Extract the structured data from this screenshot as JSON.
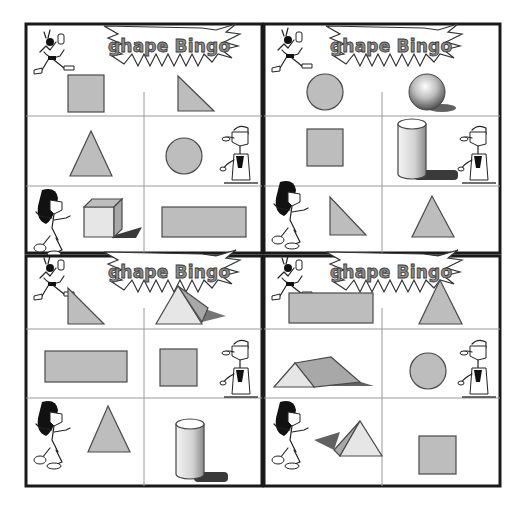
{
  "page": {
    "background": "#ffffff",
    "frame_color": "#1a1a1a",
    "shape_fill": "#bdbdbd",
    "shape_stroke": "#4a4a4a"
  },
  "cards": [
    {
      "id": "A",
      "title": "ghape Bingo",
      "cells": [
        {
          "row": 1,
          "col": 1,
          "shape": "square"
        },
        {
          "row": 1,
          "col": 2,
          "shape": "right-triangle"
        },
        {
          "row": 2,
          "col": 1,
          "shape": "triangle"
        },
        {
          "row": 2,
          "col": 2,
          "shape": "circle"
        },
        {
          "row": 3,
          "col": 1,
          "shape": "cube"
        },
        {
          "row": 3,
          "col": 2,
          "shape": "rectangle"
        }
      ]
    },
    {
      "id": "B",
      "title": "ghape Bingo",
      "cells": [
        {
          "row": 1,
          "col": 1,
          "shape": "circle"
        },
        {
          "row": 1,
          "col": 2,
          "shape": "sphere"
        },
        {
          "row": 2,
          "col": 1,
          "shape": "square"
        },
        {
          "row": 2,
          "col": 2,
          "shape": "cylinder"
        },
        {
          "row": 3,
          "col": 1,
          "shape": "right-triangle"
        },
        {
          "row": 3,
          "col": 2,
          "shape": "triangle"
        }
      ]
    },
    {
      "id": "C",
      "title": "ghape Bingo",
      "cells": [
        {
          "row": 1,
          "col": 1,
          "shape": "right-triangle"
        },
        {
          "row": 1,
          "col": 2,
          "shape": "pyramid"
        },
        {
          "row": 2,
          "col": 1,
          "shape": "rectangle"
        },
        {
          "row": 2,
          "col": 2,
          "shape": "square"
        },
        {
          "row": 3,
          "col": 1,
          "shape": "triangle"
        },
        {
          "row": 3,
          "col": 2,
          "shape": "cylinder"
        }
      ]
    },
    {
      "id": "D",
      "title": "ghape Bingo",
      "cells": [
        {
          "row": 1,
          "col": 1,
          "shape": "rectangle"
        },
        {
          "row": 1,
          "col": 2,
          "shape": "triangle"
        },
        {
          "row": 2,
          "col": 1,
          "shape": "triangular-prism"
        },
        {
          "row": 2,
          "col": 2,
          "shape": "circle"
        },
        {
          "row": 3,
          "col": 1,
          "shape": "pyramid"
        },
        {
          "row": 3,
          "col": 2,
          "shape": "square"
        }
      ]
    }
  ],
  "characters": {
    "top_left": "bird-character-icon",
    "middle_right": "man-character-icon",
    "bottom_left": "girl-character-icon"
  }
}
